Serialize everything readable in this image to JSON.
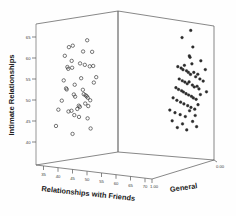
{
  "chart_data": {
    "type": "scatter",
    "title": "",
    "subtitle": "",
    "projection": "3d",
    "grid": false,
    "legend": "none",
    "xlabel": "Relationships with Friends",
    "ylabel": "Intimate Relationships",
    "zlabel": "General",
    "xticks": [
      35,
      40,
      45,
      50,
      55,
      60,
      65,
      70
    ],
    "xticklabels": [
      "35",
      "40",
      "45",
      "50",
      "55",
      "60",
      "65",
      "70"
    ],
    "yticks": [
      30,
      35,
      40,
      45,
      50,
      55,
      60,
      65
    ],
    "yticklabels": [
      "30",
      "35",
      "40",
      "45",
      "50",
      "55",
      "60",
      "65"
    ],
    "zticks": [
      0.0,
      1.0
    ],
    "zticklabels": [
      "0.00",
      "1.00"
    ],
    "xlim": [
      32,
      72
    ],
    "ylim": [
      28,
      67
    ],
    "zlim": [
      0.0,
      1.0
    ],
    "series": [
      {
        "name": "General = 1.00",
        "marker": "open-circle",
        "color": "#303030",
        "z": 1.0,
        "points": [
          [
            45.4,
            58.2
          ],
          [
            47.3,
            60.6
          ],
          [
            48.6,
            56.8
          ],
          [
            49.1,
            61.0
          ],
          [
            46.6,
            55.1
          ],
          [
            47.0,
            54.6
          ],
          [
            48.8,
            54.9
          ],
          [
            53.9,
            59.4
          ],
          [
            55.8,
            62.5
          ],
          [
            58.1,
            59.3
          ],
          [
            52.5,
            56.1
          ],
          [
            54.7,
            55.7
          ],
          [
            57.0,
            55.3
          ],
          [
            58.6,
            55.4
          ],
          [
            44.9,
            51.4
          ],
          [
            46.0,
            49.2
          ],
          [
            46.3,
            48.9
          ],
          [
            50.0,
            50.2
          ],
          [
            49.6,
            47.5
          ],
          [
            50.2,
            46.9
          ],
          [
            53.0,
            52.0
          ],
          [
            53.8,
            48.8
          ],
          [
            54.2,
            47.6
          ],
          [
            55.0,
            47.3
          ],
          [
            55.6,
            47.0
          ],
          [
            56.1,
            46.6
          ],
          [
            54.9,
            45.0
          ],
          [
            56.3,
            44.3
          ],
          [
            57.2,
            45.9
          ],
          [
            42.4,
            43.3
          ],
          [
            44.0,
            45.8
          ],
          [
            47.1,
            42.8
          ],
          [
            48.5,
            43.0
          ],
          [
            49.8,
            41.8
          ],
          [
            51.2,
            43.5
          ],
          [
            52.0,
            41.3
          ],
          [
            56.0,
            40.9
          ],
          [
            41.3,
            38.8
          ],
          [
            49.0,
            36.6
          ],
          [
            57.4,
            38.1
          ],
          [
            58.9,
            50.8
          ],
          [
            60.0,
            52.3
          ],
          [
            51.9,
            44.4
          ],
          [
            52.4,
            44.1
          ]
        ]
      },
      {
        "name": "General = 0.00",
        "marker": "filled-circle",
        "color": "#2b2b2b",
        "z": 0.0,
        "points": [
          [
            58.4,
            62.4
          ],
          [
            62.1,
            64.8
          ],
          [
            63.0,
            60.1
          ],
          [
            61.5,
            57.4
          ],
          [
            61.8,
            57.0
          ],
          [
            62.6,
            55.2
          ],
          [
            66.4,
            56.4
          ],
          [
            68.3,
            54.0
          ],
          [
            56.6,
            53.9
          ],
          [
            58.0,
            53.6
          ],
          [
            58.8,
            53.2
          ],
          [
            59.4,
            54.5
          ],
          [
            60.3,
            53.0
          ],
          [
            61.1,
            52.6
          ],
          [
            62.0,
            52.1
          ],
          [
            63.4,
            52.8
          ],
          [
            64.2,
            51.6
          ],
          [
            65.1,
            52.4
          ],
          [
            66.0,
            51.1
          ],
          [
            57.2,
            50.4
          ],
          [
            58.5,
            50.0
          ],
          [
            59.6,
            49.7
          ],
          [
            60.6,
            49.3
          ],
          [
            61.4,
            49.9
          ],
          [
            62.8,
            49.1
          ],
          [
            63.6,
            48.6
          ],
          [
            64.8,
            48.9
          ],
          [
            65.6,
            48.2
          ],
          [
            55.8,
            47.8
          ],
          [
            56.9,
            47.4
          ],
          [
            58.2,
            47.1
          ],
          [
            59.0,
            46.8
          ],
          [
            60.1,
            46.4
          ],
          [
            61.2,
            46.1
          ],
          [
            62.4,
            45.8
          ],
          [
            63.2,
            45.4
          ],
          [
            64.4,
            45.1
          ],
          [
            66.2,
            46.6
          ],
          [
            54.6,
            44.8
          ],
          [
            56.2,
            44.2
          ],
          [
            57.8,
            43.8
          ],
          [
            59.2,
            43.4
          ],
          [
            60.8,
            43.0
          ],
          [
            62.2,
            42.6
          ],
          [
            63.8,
            42.2
          ],
          [
            65.2,
            43.6
          ],
          [
            53.2,
            41.2
          ],
          [
            55.4,
            40.6
          ],
          [
            57.6,
            40.2
          ],
          [
            59.8,
            39.8
          ],
          [
            61.6,
            41.6
          ],
          [
            64.0,
            40.4
          ],
          [
            54.2,
            38.2
          ],
          [
            58.6,
            37.6
          ],
          [
            62.9,
            38.6
          ],
          [
            56.4,
            36.4
          ],
          [
            60.4,
            36.0
          ],
          [
            64.6,
            37.2
          ],
          [
            67.4,
            50.6
          ],
          [
            68.8,
            47.6
          ]
        ]
      }
    ]
  }
}
